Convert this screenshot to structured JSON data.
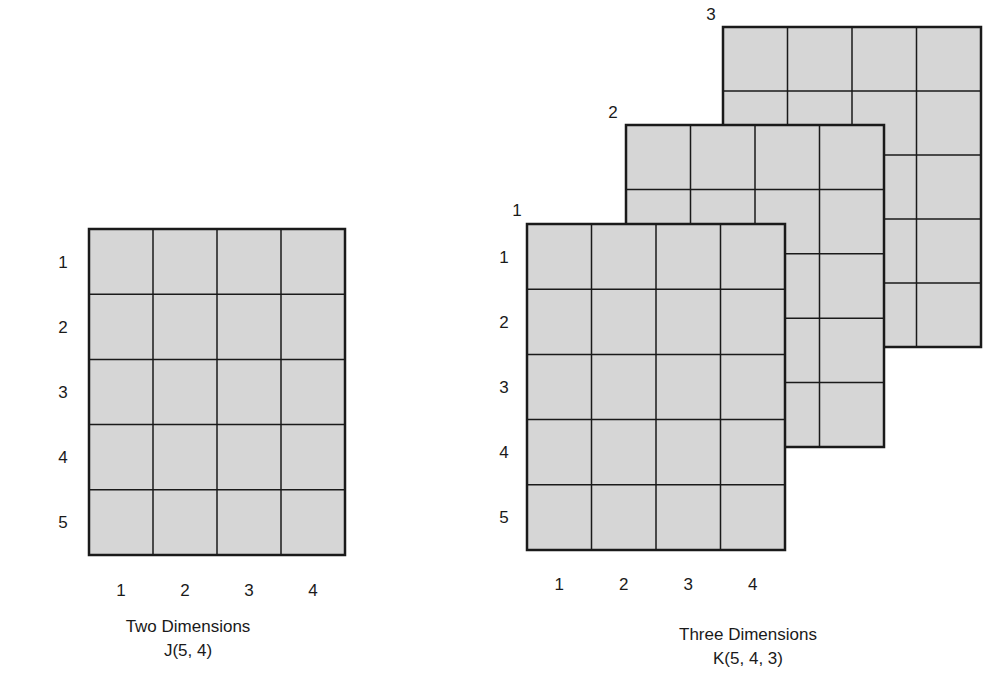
{
  "fill_color": "#d6d6d6",
  "line_color": "#1a1a1a",
  "two_d": {
    "name": "J",
    "rows": 5,
    "cols": 4,
    "row_labels": [
      "1",
      "2",
      "3",
      "4",
      "5"
    ],
    "col_labels": [
      "1",
      "2",
      "3",
      "4"
    ],
    "caption_line1": "Two Dimensions",
    "caption_line2": "J(5, 4)"
  },
  "three_d": {
    "name": "K",
    "rows": 5,
    "cols": 4,
    "pages": 3,
    "page_labels": [
      "1",
      "2",
      "3"
    ],
    "row_labels": [
      "1",
      "2",
      "3",
      "4",
      "5"
    ],
    "col_labels": [
      "1",
      "2",
      "3",
      "4"
    ],
    "caption_line1": "Three Dimensions",
    "caption_line2": "K(5, 4, 3)"
  }
}
